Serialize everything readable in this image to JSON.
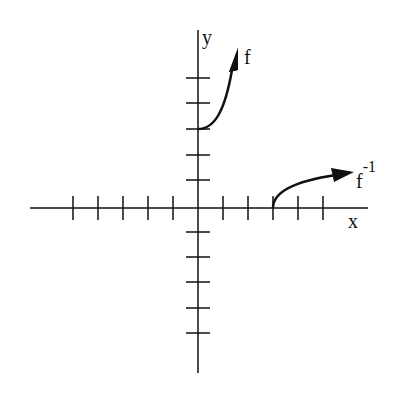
{
  "figure": {
    "axes": {
      "x_label": "x",
      "y_label": "y",
      "x_ticks": [
        -5,
        -4,
        -3,
        -2,
        -1,
        1,
        2,
        3,
        4,
        5
      ],
      "y_ticks": [
        -5,
        -4,
        -3,
        -2,
        -1,
        1,
        2,
        3,
        4,
        5
      ],
      "tick_spacing_px": 25,
      "origin_px": [
        198,
        208
      ]
    },
    "curves": [
      {
        "name": "f",
        "label": "f",
        "start": [
          0,
          3
        ],
        "description": "increasing curve starting at (0,3), arrow pointing up-right"
      },
      {
        "name": "f-inverse",
        "label": "f",
        "label_superscript": "-1",
        "start": [
          3,
          0
        ],
        "description": "increasing concave-down curve starting at (3,0), arrow pointing right"
      }
    ],
    "colors": {
      "ink": "#111111",
      "background": "#ffffff"
    }
  }
}
